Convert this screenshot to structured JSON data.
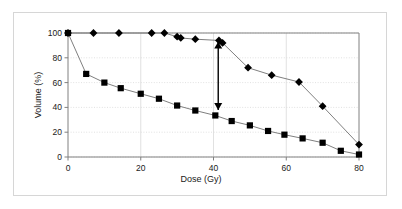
{
  "chart_data": {
    "type": "line",
    "title": "",
    "xlabel": "Dose (Gy)",
    "ylabel": "Volume (%)",
    "xlim": [
      0,
      80
    ],
    "ylim": [
      0,
      100
    ],
    "xticks": [
      0,
      20,
      40,
      60,
      80
    ],
    "yticks": [
      0,
      20,
      40,
      60,
      80,
      100
    ],
    "xtick_labels": [
      "0",
      "20",
      "40",
      "60",
      "80"
    ],
    "ytick_labels": [
      "0",
      "20",
      "40",
      "60",
      "80",
      "100"
    ],
    "grid": true,
    "legend": "none",
    "series": [
      {
        "name": "diamond-series",
        "marker": "diamond",
        "color": "#000000",
        "line_color": "#7f7f7f",
        "points": [
          {
            "x": 0,
            "y": 100
          },
          {
            "x": 7,
            "y": 100
          },
          {
            "x": 14,
            "y": 100
          },
          {
            "x": 23,
            "y": 100
          },
          {
            "x": 26.5,
            "y": 100
          },
          {
            "x": 30,
            "y": 97
          },
          {
            "x": 31,
            "y": 96
          },
          {
            "x": 35,
            "y": 95
          },
          {
            "x": 41.5,
            "y": 94
          },
          {
            "x": 42.5,
            "y": 92
          },
          {
            "x": 49.5,
            "y": 72
          },
          {
            "x": 56,
            "y": 66
          },
          {
            "x": 63.5,
            "y": 60.5
          },
          {
            "x": 70,
            "y": 41
          },
          {
            "x": 80,
            "y": 10
          }
        ]
      },
      {
        "name": "square-series",
        "marker": "square",
        "color": "#000000",
        "line_color": "#7f7f7f",
        "points": [
          {
            "x": 0,
            "y": 100
          },
          {
            "x": 5,
            "y": 67
          },
          {
            "x": 10,
            "y": 60
          },
          {
            "x": 14.5,
            "y": 55.5
          },
          {
            "x": 20,
            "y": 51
          },
          {
            "x": 25,
            "y": 47
          },
          {
            "x": 30,
            "y": 41.5
          },
          {
            "x": 35,
            "y": 37.5
          },
          {
            "x": 40.5,
            "y": 33.5
          },
          {
            "x": 45,
            "y": 29
          },
          {
            "x": 50,
            "y": 25.5
          },
          {
            "x": 55,
            "y": 21
          },
          {
            "x": 59.5,
            "y": 18
          },
          {
            "x": 64.5,
            "y": 15
          },
          {
            "x": 70,
            "y": 11.5
          },
          {
            "x": 75,
            "y": 5
          },
          {
            "x": 80,
            "y": 2
          }
        ]
      }
    ],
    "annotations": [
      {
        "name": "vertical-range-arrow",
        "type": "double-headed-arrow",
        "x": 41.3,
        "y_top": 93,
        "y_bottom": 38,
        "color": "#000000"
      }
    ]
  },
  "colors": {
    "frame_border": "#d6d6d6",
    "axis_line": "#808080",
    "gridline": "#d9d9d9",
    "marker": "#000000",
    "series_line": "#808080",
    "text": "#1a1a1a",
    "background": "#ffffff"
  }
}
